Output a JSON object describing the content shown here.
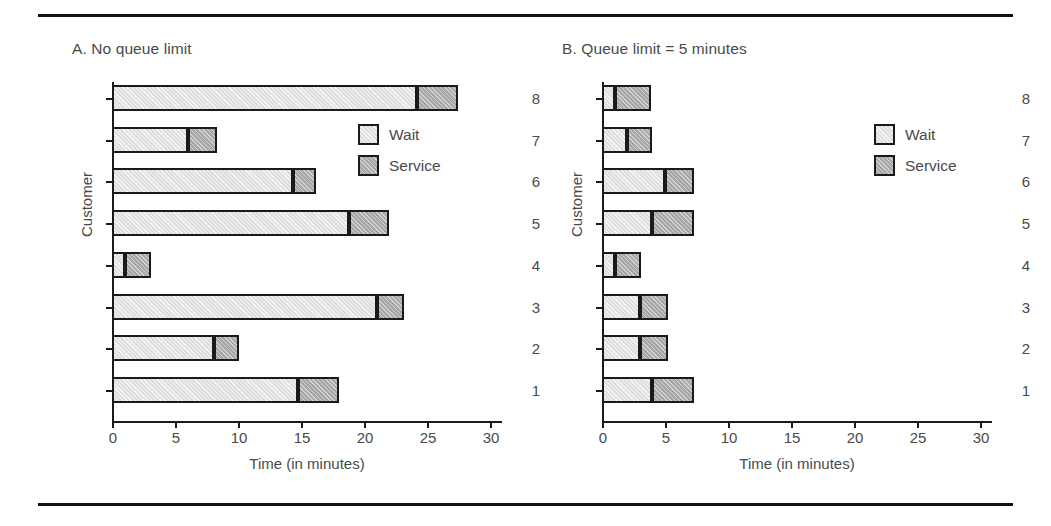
{
  "figure": {
    "has_top_rule": true,
    "has_bottom_rule": true,
    "background": "#ffffff"
  },
  "colors": {
    "wait": "#dedede",
    "service": "#a6a6a6",
    "outline": "#1a1a1a",
    "text": "#4a4a4a"
  },
  "legend": {
    "wait_label": "Wait",
    "service_label": "Service"
  },
  "chart_data": [
    {
      "type": "bar",
      "orientation": "horizontal",
      "stacked": true,
      "panel": "A",
      "title": "A. No queue limit",
      "xlabel": "Time (in minutes)",
      "ylabel": "Customer",
      "xlim": [
        0,
        32
      ],
      "xticks": [
        0,
        5,
        10,
        15,
        20,
        25,
        30
      ],
      "xticklabels": [
        "0",
        "5",
        "10",
        "15",
        "20",
        "25",
        "30"
      ],
      "categories": [
        "1",
        "2",
        "3",
        "4",
        "5",
        "6",
        "7",
        "8"
      ],
      "yticklabels": [
        "8",
        "7",
        "6",
        "5",
        "4",
        "3",
        "2",
        "1"
      ],
      "grid": false,
      "legend_position": "inside-right-upper",
      "series": [
        {
          "name": "Wait",
          "values": [
            14.8,
            8.1,
            21.0,
            1.0,
            18.8,
            14.4,
            6.0,
            24.2
          ]
        },
        {
          "name": "Service",
          "values": [
            3.2,
            2.0,
            2.2,
            2.1,
            3.2,
            1.8,
            2.3,
            3.3
          ]
        }
      ],
      "totals": [
        18.0,
        10.1,
        23.2,
        3.1,
        22.0,
        16.2,
        8.3,
        27.5
      ]
    },
    {
      "type": "bar",
      "orientation": "horizontal",
      "stacked": true,
      "panel": "B",
      "title": "B. Queue limit = 5 minutes",
      "xlabel": "Time (in minutes)",
      "ylabel": "Customer",
      "xlim": [
        0,
        32
      ],
      "xticks": [
        0,
        5,
        10,
        15,
        20,
        25,
        30
      ],
      "xticklabels": [
        "0",
        "5",
        "10",
        "15",
        "20",
        "25",
        "30"
      ],
      "categories": [
        "1",
        "2",
        "3",
        "4",
        "5",
        "6",
        "7",
        "8"
      ],
      "yticklabels": [
        "8",
        "7",
        "6",
        "5",
        "4",
        "3",
        "2",
        "1"
      ],
      "grid": false,
      "legend_position": "inside-right-upper",
      "series": [
        {
          "name": "Wait",
          "values": [
            4.0,
            3.0,
            3.0,
            1.0,
            4.0,
            5.0,
            2.0,
            1.0
          ]
        },
        {
          "name": "Service",
          "values": [
            3.3,
            2.2,
            2.2,
            2.1,
            3.3,
            2.3,
            2.0,
            2.9
          ]
        }
      ],
      "totals": [
        7.3,
        5.2,
        5.2,
        3.1,
        7.3,
        7.3,
        4.0,
        3.9
      ]
    }
  ]
}
